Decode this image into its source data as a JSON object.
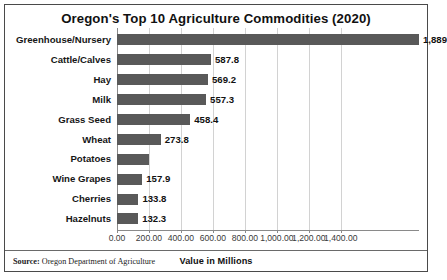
{
  "chart": {
    "title": "Oregon's Top 10 Agriculture Commodities (2020)",
    "axis_title": "Value in Millions",
    "source_label": "Source:",
    "source_text": "Oregon Department of Agriculture"
  },
  "chart_data": {
    "type": "bar",
    "orientation": "horizontal",
    "title": "Oregon's Top 10 Agriculture Commodities (2020)",
    "xlabel": "Value in Millions",
    "ylabel": "",
    "xlim": [
      0,
      1889
    ],
    "grid": true,
    "legend": "none",
    "tick_labels": [
      "0.00",
      "200.00",
      "400.00",
      "600.00",
      "800.00",
      "1,000.00",
      "1,200.00",
      "1,400.00"
    ],
    "tick_values": [
      0,
      200,
      400,
      600,
      800,
      1000,
      1200,
      1400
    ],
    "categories": [
      "Greenhouse/Nursery",
      "Cattle/Calves",
      "Hay",
      "Milk",
      "Grass Seed",
      "Wheat",
      "Potatoes",
      "Wine Grapes",
      "Cherries",
      "Hazelnuts"
    ],
    "values": [
      1889,
      587.8,
      569.2,
      557.3,
      458.4,
      273.8,
      200,
      157.9,
      133.8,
      132.3
    ],
    "data_labels": [
      "1,889",
      "587.8",
      "569.2",
      "557.3",
      "458.4",
      "273.8",
      "",
      "157.9",
      "133.8",
      "132.3"
    ],
    "bar_color": "#595959",
    "gridline_color": "#d2d2d2"
  }
}
